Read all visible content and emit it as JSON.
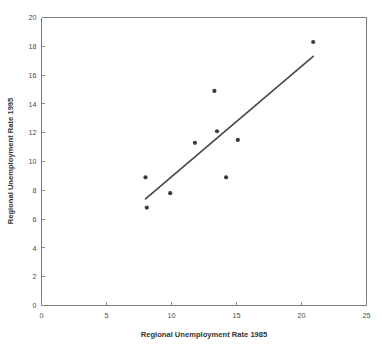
{
  "chart_data": {
    "type": "scatter",
    "title": "",
    "xlabel": "Regional Unemployment Rate 1985",
    "ylabel": "Regional Unemployment Rate 1995",
    "xlim": [
      0,
      25
    ],
    "ylim": [
      0,
      20
    ],
    "xticks": [
      0,
      5,
      10,
      15,
      20,
      25
    ],
    "yticks": [
      0,
      2,
      4,
      6,
      8,
      10,
      12,
      14,
      16,
      18,
      20
    ],
    "grid": false,
    "legend": null,
    "marker_color": "#3b3b3b",
    "line_color": "#4a4a4a",
    "frame_color": "#7a7a7a",
    "background_color": "#ffffff",
    "points": [
      {
        "x": 8.0,
        "y": 8.9
      },
      {
        "x": 8.1,
        "y": 6.8
      },
      {
        "x": 9.9,
        "y": 7.8
      },
      {
        "x": 11.8,
        "y": 11.3
      },
      {
        "x": 13.3,
        "y": 14.9
      },
      {
        "x": 13.5,
        "y": 12.1
      },
      {
        "x": 14.2,
        "y": 8.9
      },
      {
        "x": 15.1,
        "y": 11.5
      },
      {
        "x": 20.9,
        "y": 18.3
      }
    ],
    "trend_line": {
      "x_start": 8.0,
      "y_start": 7.4,
      "x_end": 20.9,
      "y_end": 17.3
    }
  },
  "axis_labels": {
    "x_title": "Regional Unemployment Rate 1985",
    "y_title": "Regional Unemployment Rate 1995"
  }
}
